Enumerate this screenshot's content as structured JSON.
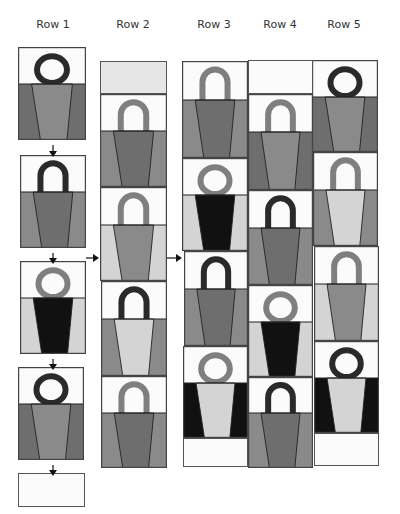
{
  "colors": {
    "white": "#fbfbfb",
    "light": "#d4d4d4",
    "mid": "#8a8a8a",
    "dark": "#6e6e6e",
    "black": "#111111",
    "ring_dark": "#2a2a2a",
    "ring_mid": "#7f7f7f",
    "border": "#444444",
    "top_gray": "#e6e6e6"
  },
  "columns": [
    {
      "label": "Row 1",
      "label_x": 18
    },
    {
      "label": "Row 2",
      "label_x": 98
    },
    {
      "label": "Row 3",
      "label_x": 179
    },
    {
      "label": "Row 4",
      "label_x": 245
    },
    {
      "label": "Row 5",
      "label_x": 309
    }
  ],
  "tiles": [
    {
      "col": 1,
      "x": 18,
      "y": 47,
      "w": 68,
      "h": 93,
      "handle": "ring",
      "handle_color": "ring_dark",
      "cup": "mid",
      "sides": "dark"
    },
    {
      "col": 1,
      "x": 20,
      "y": 155,
      "w": 66,
      "h": 93,
      "handle": "arch",
      "handle_color": "ring_dark",
      "cup": "dark",
      "sides": "mid"
    },
    {
      "col": 1,
      "x": 20,
      "y": 261,
      "w": 66,
      "h": 93,
      "handle": "ring",
      "handle_color": "ring_mid",
      "cup": "black",
      "sides": "light"
    },
    {
      "col": 1,
      "x": 18,
      "y": 367,
      "w": 66,
      "h": 93,
      "handle": "ring",
      "handle_color": "ring_dark",
      "cup": "mid",
      "sides": "dark"
    },
    {
      "col": 2,
      "x": 100,
      "y": 94,
      "w": 67,
      "h": 93,
      "handle": "arch",
      "handle_color": "ring_mid",
      "cup": "dark",
      "sides": "mid"
    },
    {
      "col": 2,
      "x": 100,
      "y": 187,
      "w": 67,
      "h": 94,
      "handle": "arch",
      "handle_color": "ring_mid",
      "cup": "mid",
      "sides": "light"
    },
    {
      "col": 2,
      "x": 101,
      "y": 281,
      "w": 66,
      "h": 95,
      "handle": "arch",
      "handle_color": "ring_dark",
      "cup": "light",
      "sides": "mid"
    },
    {
      "col": 2,
      "x": 101,
      "y": 376,
      "w": 66,
      "h": 92,
      "handle": "arch",
      "handle_color": "ring_mid",
      "cup": "dark",
      "sides": "mid"
    },
    {
      "col": 3,
      "x": 182,
      "y": 61,
      "w": 66,
      "h": 97,
      "handle": "arch",
      "handle_color": "ring_mid",
      "cup": "dark",
      "sides": "mid"
    },
    {
      "col": 3,
      "x": 182,
      "y": 158,
      "w": 66,
      "h": 93,
      "handle": "ring",
      "handle_color": "ring_mid",
      "cup": "black",
      "sides": "light"
    },
    {
      "col": 3,
      "x": 184,
      "y": 251,
      "w": 64,
      "h": 95,
      "handle": "arch",
      "handle_color": "ring_dark",
      "cup": "dark",
      "sides": "mid"
    },
    {
      "col": 3,
      "x": 183,
      "y": 346,
      "w": 65,
      "h": 92,
      "handle": "ring",
      "handle_color": "ring_mid",
      "cup": "light",
      "sides": "black"
    },
    {
      "col": 4,
      "x": 248,
      "y": 94,
      "w": 65,
      "h": 96,
      "handle": "arch",
      "handle_color": "ring_mid",
      "cup": "mid",
      "sides": "dark"
    },
    {
      "col": 4,
      "x": 248,
      "y": 190,
      "w": 65,
      "h": 95,
      "handle": "arch",
      "handle_color": "ring_dark",
      "cup": "dark",
      "sides": "mid"
    },
    {
      "col": 4,
      "x": 248,
      "y": 285,
      "w": 65,
      "h": 92,
      "handle": "ring",
      "handle_color": "ring_mid",
      "cup": "black",
      "sides": "light"
    },
    {
      "col": 4,
      "x": 248,
      "y": 377,
      "w": 65,
      "h": 91,
      "handle": "arch",
      "handle_color": "ring_dark",
      "cup": "dark",
      "sides": "mid"
    },
    {
      "col": 5,
      "x": 312,
      "y": 60,
      "w": 66,
      "h": 92,
      "handle": "ring",
      "handle_color": "ring_dark",
      "cup": "mid",
      "sides": "dark"
    },
    {
      "col": 5,
      "x": 313,
      "y": 152,
      "w": 65,
      "h": 94,
      "handle": "arch",
      "handle_color": "ring_mid",
      "cup": "light",
      "sides": "mid"
    },
    {
      "col": 5,
      "x": 314,
      "y": 246,
      "w": 65,
      "h": 95,
      "handle": "arch",
      "handle_color": "ring_mid",
      "cup": "mid",
      "sides": "light"
    },
    {
      "col": 5,
      "x": 314,
      "y": 341,
      "w": 65,
      "h": 92,
      "handle": "ring",
      "handle_color": "ring_dark",
      "cup": "light",
      "sides": "black"
    }
  ],
  "blanks": [
    {
      "x": 18,
      "y": 473,
      "w": 67,
      "h": 34,
      "fill": "white"
    },
    {
      "x": 100,
      "y": 61,
      "w": 67,
      "h": 33,
      "fill": "top_gray"
    },
    {
      "x": 248,
      "y": 60,
      "w": 65,
      "h": 34,
      "fill": "white"
    },
    {
      "x": 183,
      "y": 438,
      "w": 65,
      "h": 29,
      "fill": "white"
    },
    {
      "x": 314,
      "y": 433,
      "w": 65,
      "h": 33,
      "fill": "white"
    }
  ],
  "arrows": [
    {
      "dir": "down",
      "x": 53,
      "y": 142,
      "len": 12
    },
    {
      "dir": "down",
      "x": 53,
      "y": 249,
      "len": 11
    },
    {
      "dir": "down",
      "x": 53,
      "y": 355,
      "len": 11
    },
    {
      "dir": "down",
      "x": 53,
      "y": 461,
      "len": 11
    },
    {
      "dir": "right",
      "x": 86,
      "y": 253,
      "len": 13
    },
    {
      "dir": "right",
      "x": 167,
      "y": 253,
      "len": 15
    }
  ]
}
